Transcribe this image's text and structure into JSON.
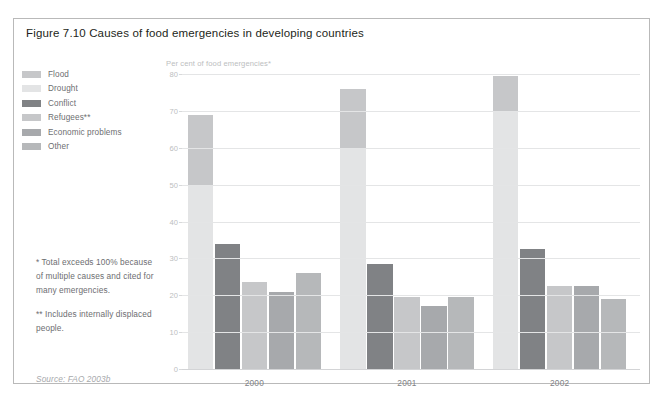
{
  "figure": {
    "title": "Figure 7.10 Causes of food emergencies in developing countries",
    "source": "Source: FAO 2003b"
  },
  "legend": {
    "items": [
      {
        "label": "Flood",
        "color": "#c6c7c9"
      },
      {
        "label": "Drought",
        "color": "#e3e4e5"
      },
      {
        "label": "Conflict",
        "color": "#808285"
      },
      {
        "label": "Refugees**",
        "color": "#c6c7c9"
      },
      {
        "label": "Economic problems",
        "color": "#a7a9ac"
      },
      {
        "label": "Other",
        "color": "#b6b8ba"
      }
    ]
  },
  "footnotes": [
    "* Total exceeds 100% because of multiple causes and cited for many emergencies.",
    "** Includes internally displaced people."
  ],
  "chart_data": {
    "type": "bar",
    "title": "Figure 7.10 Causes of food emergencies in developing countries",
    "xlabel": "",
    "ylabel": "Per cent of food emergencies*",
    "ylim": [
      0,
      80
    ],
    "yticks": [
      0,
      10,
      20,
      30,
      40,
      50,
      60,
      70,
      80
    ],
    "grid": true,
    "legend_position": "left",
    "categories": [
      "2000",
      "2001",
      "2002"
    ],
    "series": [
      {
        "name": "Flood",
        "color": "#c6c7c9",
        "values": [
          19,
          16,
          9.5
        ],
        "stacked_on": "Drought"
      },
      {
        "name": "Drought",
        "color": "#e3e4e5",
        "values": [
          50,
          60,
          70
        ]
      },
      {
        "name": "Conflict",
        "color": "#808285",
        "values": [
          34,
          28.5,
          32.5
        ]
      },
      {
        "name": "Refugees**",
        "color": "#c6c7c9",
        "values": [
          23.5,
          19.5,
          22.5
        ]
      },
      {
        "name": "Economic problems",
        "color": "#a7a9ac",
        "values": [
          21,
          17,
          22.5
        ]
      },
      {
        "name": "Other",
        "color": "#b6b8ba",
        "values": [
          26,
          19.5,
          19
        ]
      }
    ],
    "column_totals": {
      "2000": [
        69,
        34,
        23.5,
        21,
        26
      ],
      "2001": [
        76,
        28.5,
        19.5,
        17,
        19.5
      ],
      "2002": [
        79.5,
        32.5,
        22.5,
        22.5,
        19
      ]
    },
    "notes": [
      "* Total exceeds 100% because of multiple causes and cited for many emergencies.",
      "** Includes internally displaced people."
    ],
    "source": "Source: FAO 2003b"
  }
}
